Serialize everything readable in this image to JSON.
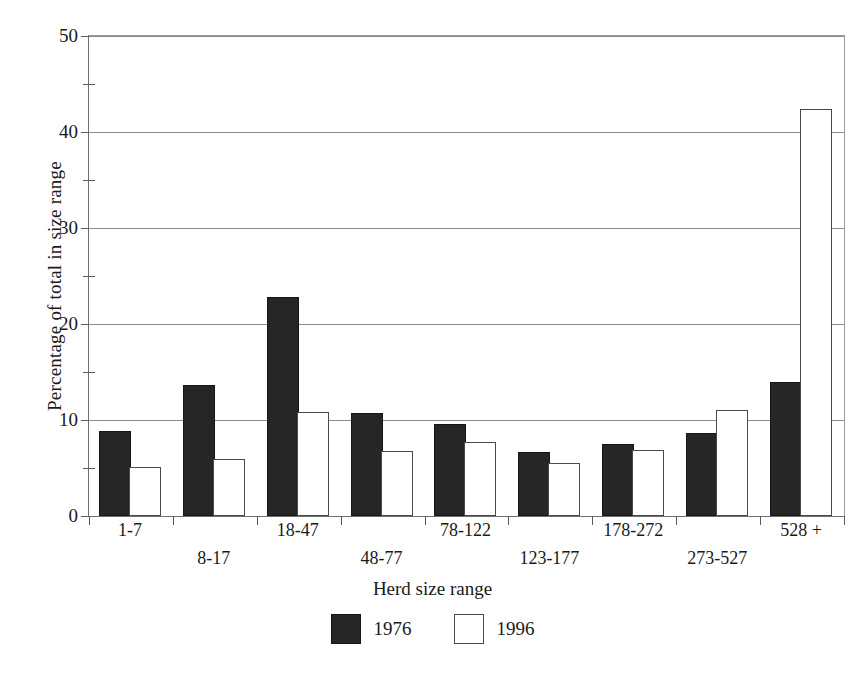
{
  "chart_data": {
    "type": "bar",
    "title": "",
    "xlabel": "Herd size range",
    "ylabel": "Percentage of total in size range",
    "categories": [
      "1-7",
      "8-17",
      "18-47",
      "48-77",
      "78-122",
      "123-177",
      "178-272",
      "273-527",
      "528 +"
    ],
    "series": [
      {
        "name": "1976",
        "color": "#262626",
        "values": [
          8.6,
          13.4,
          22.6,
          10.5,
          9.4,
          6.5,
          7.3,
          8.4,
          13.8
        ]
      },
      {
        "name": "1996",
        "color": "#ffffff",
        "values": [
          4.9,
          5.7,
          10.6,
          6.6,
          7.5,
          5.3,
          6.7,
          10.8,
          42.2
        ]
      }
    ],
    "ylim": [
      0,
      50
    ],
    "yticks": [
      0,
      10,
      20,
      30,
      40,
      50
    ],
    "ytick_labels": [
      "0",
      "10",
      "20",
      "30",
      "40",
      "50"
    ],
    "yticks_minor": [
      5,
      15,
      25,
      35,
      45
    ],
    "grid": "horizontal-major",
    "legend_position": "bottom-center"
  },
  "legend": {
    "items": [
      {
        "label": "1976",
        "swatch": "filled-dark-square"
      },
      {
        "label": "1996",
        "swatch": "open-white-square"
      }
    ]
  },
  "axes": {
    "x_title": "Herd size range",
    "y_title": "Percentage of total in size range"
  }
}
